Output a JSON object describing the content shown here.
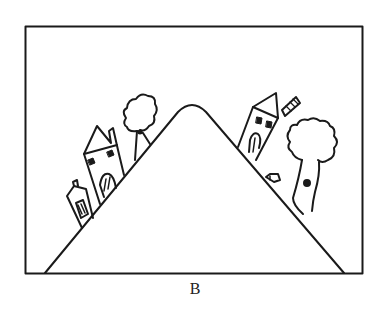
{
  "figure": {
    "caption": "B",
    "colors": {
      "stroke": "#1a1a1a",
      "background": "#ffffff"
    },
    "elements": {
      "frame": "rectangle-border",
      "hill": "triangular-mountain-with-rounded-peak",
      "left_slope": [
        "small-house-with-chimney",
        "tall-house-with-arched-door",
        "tree"
      ],
      "right_slope": [
        "house-with-ladder-chimney",
        "small-stone",
        "large-tree-with-knot"
      ]
    }
  }
}
